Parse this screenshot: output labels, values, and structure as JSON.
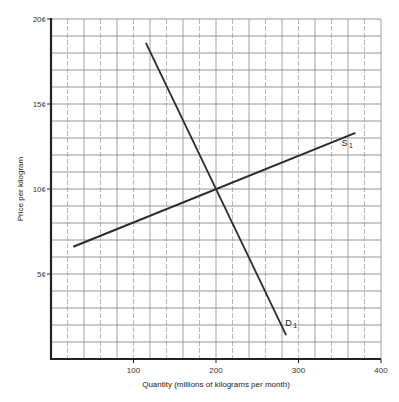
{
  "chart_data": {
    "type": "line",
    "title": "",
    "xlabel": "Quantity (millions of kilograms per month)",
    "ylabel": "Price per kilogram",
    "xlim": [
      0,
      400
    ],
    "ylim": [
      0,
      20
    ],
    "x_ticks": [
      {
        "value": 100,
        "label": "100"
      },
      {
        "value": 200,
        "label": "200"
      },
      {
        "value": 300,
        "label": "300"
      },
      {
        "value": 400,
        "label": "400"
      }
    ],
    "y_ticks": [
      {
        "value": 5,
        "label": "5¢"
      },
      {
        "value": 10,
        "label": "10¢"
      },
      {
        "value": 15,
        "label": "15¢"
      },
      {
        "value": 20,
        "label": "20¢"
      }
    ],
    "grid": true,
    "grid_x_step": 20,
    "grid_y_step": 1,
    "series": [
      {
        "name": "S1",
        "label_main": "S",
        "label_sub": "1",
        "kind": "supply",
        "points": [
          [
            27,
            6.6
          ],
          [
            369,
            13.3
          ]
        ]
      },
      {
        "name": "D1",
        "label_main": "D",
        "label_sub": "1",
        "kind": "demand",
        "points": [
          [
            115,
            18.6
          ],
          [
            285,
            1.4
          ]
        ]
      }
    ],
    "annotations": [
      {
        "text": "Equilibrium (intersection)",
        "x": 200,
        "y": 10
      }
    ]
  },
  "colors": {
    "line": "#2b2b2b",
    "grid": "#8a8a8a",
    "axis": "#222222"
  }
}
